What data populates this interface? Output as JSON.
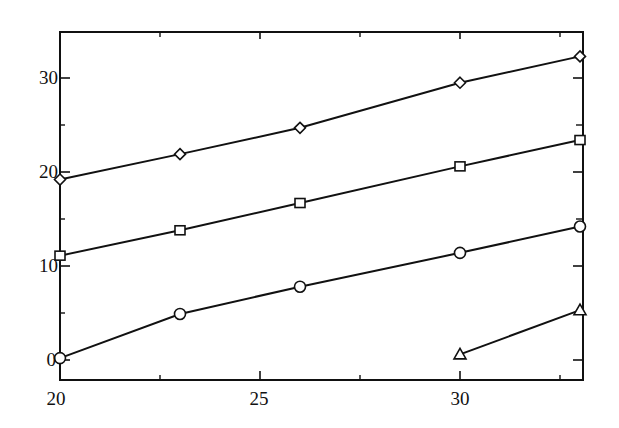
{
  "chart_data": {
    "type": "line",
    "title": "",
    "xlabel": "",
    "ylabel": "",
    "xlim": [
      20,
      33.1
    ],
    "ylim": [
      -2.2,
      35
    ],
    "grid": false,
    "legend": null,
    "x_ticks": [
      20,
      25,
      30
    ],
    "y_ticks": [
      0,
      10,
      20,
      30
    ],
    "series": [
      {
        "name": "diamond",
        "marker": "diamond",
        "x": [
          20,
          23,
          26,
          30,
          33
        ],
        "values": [
          19.2,
          21.9,
          24.7,
          29.5,
          32.3
        ]
      },
      {
        "name": "square",
        "marker": "square",
        "x": [
          20,
          23,
          26,
          30,
          33
        ],
        "values": [
          11.1,
          13.8,
          16.7,
          20.6,
          23.4
        ]
      },
      {
        "name": "circle",
        "marker": "circle",
        "x": [
          20,
          23,
          26,
          30,
          33
        ],
        "values": [
          0.2,
          4.9,
          7.8,
          11.4,
          14.2
        ]
      },
      {
        "name": "triangle",
        "marker": "triangle",
        "x": [
          30,
          33
        ],
        "values": [
          0.6,
          5.3
        ]
      }
    ]
  },
  "axes": {
    "x_tick_labels": [
      "20",
      "25",
      "30"
    ],
    "y_tick_labels": [
      "0",
      "10",
      "20",
      "30"
    ]
  },
  "colors": {
    "line": "#111111",
    "background": "#ffffff"
  }
}
